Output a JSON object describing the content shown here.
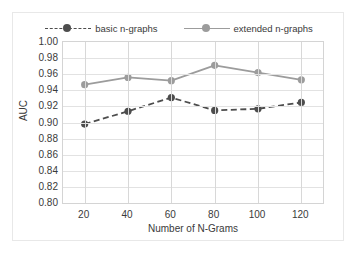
{
  "chart_data": {
    "type": "line",
    "title": "",
    "xlabel": "Number of N-Grams",
    "ylabel": "AUC",
    "x": [
      20,
      40,
      60,
      80,
      100,
      120
    ],
    "xticklabels": [
      "20",
      "40",
      "60",
      "80",
      "100",
      "120"
    ],
    "yticklabels": [
      "1.00",
      "0.98",
      "0.96",
      "0.94",
      "0.92",
      "0.90",
      "0.88",
      "0.86",
      "0.84",
      "0.82",
      "0.80"
    ],
    "ylim": [
      0.8,
      1.0
    ],
    "ytick_step": 0.02,
    "xlim": [
      10,
      130
    ],
    "grid": "both",
    "legend_position": "top-center",
    "series": [
      {
        "name": "basic n-graphs",
        "values": [
          0.898,
          0.914,
          0.931,
          0.915,
          0.917,
          0.925
        ],
        "color": "#4d4d4d",
        "linestyle": "dashed",
        "marker": "circle"
      },
      {
        "name": "extended n-graphs",
        "values": [
          0.947,
          0.956,
          0.952,
          0.971,
          0.962,
          0.953
        ],
        "color": "#9c9c9c",
        "linestyle": "solid",
        "marker": "circle"
      }
    ]
  },
  "legend": {
    "entries": [
      {
        "label": "basic n-graphs"
      },
      {
        "label": "extended n-graphs"
      }
    ]
  },
  "axes": {
    "y_title": "AUC",
    "x_title": "Number of N-Grams"
  }
}
